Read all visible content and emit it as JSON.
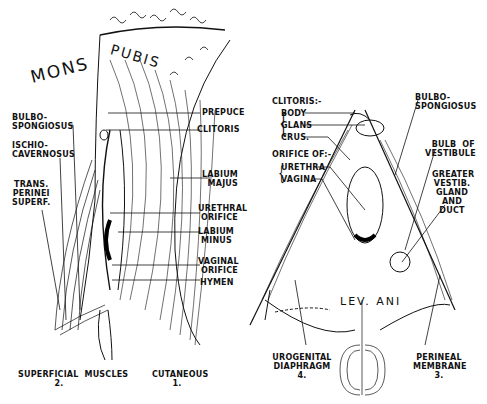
{
  "figure": {
    "left_panel": {
      "region_label_1": "MONS",
      "region_label_2": "PUBIS",
      "left_labels": {
        "bulbospongiosus": "BULBO-\nSPONGIOSUS",
        "ischiocavernosus": "ISCHIO-\nCAVERNOSUS",
        "trans_perinei": "TRANS.\nPERINEI\nSUPERF."
      },
      "right_labels": {
        "prepuce": "PREPUCE",
        "clitoris": "CLITORIS",
        "labium_majus": "LABIUM\nMAJUS",
        "urethral_orifice": "URETHRAL\nORIFICE",
        "labium_minus": "LABIUM\nMINUS",
        "vaginal_orifice": "VAGINAL\nORIFICE",
        "hymen": "HYMEN"
      },
      "captions": {
        "superficial": "SUPERFICIAL  MUSCLES\n2.",
        "cutaneous": "CUTANEOUS\n1."
      }
    },
    "right_panel": {
      "clitoris_header": "CLITORIS:-",
      "clitoris_parts": [
        "BODY",
        "GLANS",
        "CRUS."
      ],
      "orifice_header": "ORIFICE OF:-",
      "orifice_parts": [
        "URETHRA",
        "VAGINA"
      ],
      "right_labels": {
        "bulbospongiosus": "BULBO-\nSPONGIOSUS",
        "bulb_vestibule": "BULB  OF\nVESTIBULE",
        "greater_vestib": "GREATER\nVESTIB.\nGLAND\nAND\nDUCT"
      },
      "levator_ani": "LEV.  ANI",
      "captions": {
        "urogenital": "UROGENITAL\nDIAPHRAGM\n4.",
        "perineal": "PERINEAL\nMEMBRANE\n3."
      }
    }
  }
}
